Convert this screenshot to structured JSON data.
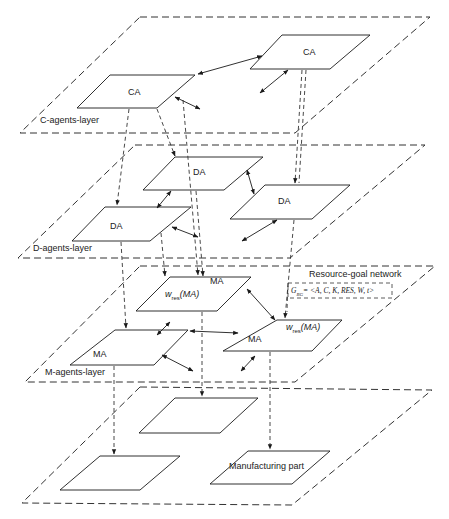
{
  "diagram": {
    "layers": [
      {
        "id": "c-layer",
        "label": "C-agents-layer",
        "points": [
          [
            140,
            17
          ],
          [
            430,
            17
          ],
          [
            295,
            133
          ],
          [
            20,
            133
          ]
        ],
        "label_pos": [
          40,
          116
        ]
      },
      {
        "id": "d-layer",
        "label": "D-agents-layer",
        "points": [
          [
            135,
            145
          ],
          [
            425,
            145
          ],
          [
            290,
            258
          ],
          [
            18,
            258
          ]
        ],
        "label_pos": [
          33,
          244
        ]
      },
      {
        "id": "m-layer",
        "label": "M-agents-layer",
        "points": [
          [
            140,
            266
          ],
          [
            435,
            266
          ],
          [
            295,
            382
          ],
          [
            25,
            382
          ]
        ],
        "label_pos": [
          45,
          368
        ]
      },
      {
        "id": "part-layer",
        "label": "",
        "points": [
          [
            140,
            387
          ],
          [
            432,
            390
          ],
          [
            292,
            505
          ],
          [
            22,
            503
          ]
        ]
      }
    ],
    "nodes": [
      {
        "id": "ca1",
        "label": "CA",
        "points": [
          [
            110,
            75
          ],
          [
            195,
            75
          ],
          [
            157,
            108
          ],
          [
            77,
            108
          ]
        ],
        "label_pos": [
          128,
          88
        ]
      },
      {
        "id": "ca2",
        "label": "CA",
        "points": [
          [
            282,
            35
          ],
          [
            370,
            35
          ],
          [
            330,
            69
          ],
          [
            250,
            69
          ]
        ],
        "label_pos": [
          303,
          48
        ]
      },
      {
        "id": "da1",
        "label": "DA",
        "points": [
          [
            175,
            157
          ],
          [
            263,
            157
          ],
          [
            224,
            190
          ],
          [
            143,
            190
          ]
        ],
        "label_pos": [
          193,
          168
        ]
      },
      {
        "id": "da2",
        "label": "DA",
        "points": [
          [
            265,
            185
          ],
          [
            350,
            185
          ],
          [
            312,
            219
          ],
          [
            230,
            219
          ]
        ],
        "label_pos": [
          278,
          197
        ]
      },
      {
        "id": "da3",
        "label": "DA",
        "points": [
          [
            105,
            207
          ],
          [
            191,
            207
          ],
          [
            150,
            241
          ],
          [
            72,
            241
          ]
        ],
        "label_pos": [
          110,
          222
        ]
      },
      {
        "id": "ma1",
        "label": "MA",
        "sub_label": "w_res(MA)",
        "points": [
          [
            170,
            277
          ],
          [
            251,
            277
          ],
          [
            217,
            311
          ],
          [
            136,
            311
          ]
        ],
        "label_pos": [
          210,
          277
        ],
        "sub_pos": [
          165,
          290
        ]
      },
      {
        "id": "ma2",
        "label": "MA",
        "sub_label": "w_res(MA)",
        "points": [
          [
            277,
            320
          ],
          [
            342,
            320
          ],
          [
            312,
            351
          ],
          [
            223,
            351
          ]
        ],
        "label_pos": [
          248,
          335
        ],
        "sub_pos": [
          286,
          323
        ]
      },
      {
        "id": "ma3",
        "label": "MA",
        "points": [
          [
            115,
            330
          ],
          [
            188,
            330
          ],
          [
            154,
            365
          ],
          [
            70,
            365
          ]
        ],
        "label_pos": [
          93,
          350
        ]
      },
      {
        "id": "p1",
        "label": "",
        "points": [
          [
            175,
            398
          ],
          [
            258,
            398
          ],
          [
            220,
            433
          ],
          [
            139,
            433
          ]
        ]
      },
      {
        "id": "p2",
        "label": "",
        "points": [
          [
            100,
            456
          ],
          [
            180,
            456
          ],
          [
            140,
            490
          ],
          [
            60,
            490
          ]
        ]
      },
      {
        "id": "p3",
        "label": "Manufacturing part",
        "points": [
          [
            248,
            451
          ],
          [
            330,
            451
          ],
          [
            292,
            484
          ],
          [
            210,
            484
          ]
        ],
        "label_pos": [
          229,
          462
        ]
      }
    ],
    "resource_goal_network": {
      "title": "Resource-goal network",
      "title_pos": [
        309,
        270
      ],
      "formula": "G_RG= <A, C, K, RES, W, t>",
      "formula_display": "G RG= <A, C, K, RES, W, t>",
      "box": [
        288,
        283,
        392,
        298
      ]
    },
    "colors": {
      "line": "#1a1a1a",
      "dashed": "#333333",
      "background": "#ffffff"
    }
  }
}
